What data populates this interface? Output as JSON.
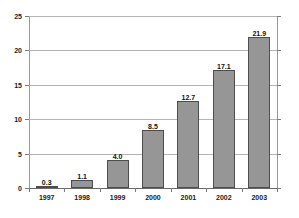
{
  "chart_data": {
    "type": "bar",
    "title": "",
    "subtitle": "",
    "xlabel": "",
    "ylabel": "",
    "categories": [
      "1997",
      "1998",
      "1999",
      "2000",
      "2001",
      "2002",
      "2003"
    ],
    "values": [
      0.3,
      1.1,
      4.0,
      8.5,
      12.7,
      17.1,
      21.9
    ],
    "value_labels": [
      "0.3",
      "1.1",
      "4.0",
      "8.5",
      "12.7",
      "17.1",
      "21.9"
    ],
    "ylim": [
      0,
      25
    ],
    "ytick_values": [
      0,
      5,
      10,
      15,
      20,
      25
    ],
    "ytick_labels": [
      "0",
      "5",
      "10",
      "15",
      "20",
      "25"
    ],
    "grid": true,
    "grid_axis": "y",
    "legend": false,
    "legend_position": "none",
    "series": [
      {
        "name": "",
        "values": [
          0.3,
          1.1,
          4.0,
          8.5,
          12.7,
          17.1,
          21.9
        ]
      }
    ],
    "colors": {
      "bar_fill": "#969696",
      "bar_border": "#4d4d4d",
      "gridline": "#b4b4b4",
      "axis": "#7a7a7a",
      "text": "#1a1a1a",
      "background": "#ffffff"
    }
  }
}
